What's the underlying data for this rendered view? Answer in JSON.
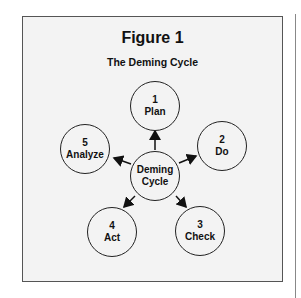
{
  "figure": {
    "title": "Figure 1",
    "subtitle": "The Deming Cycle"
  },
  "center": {
    "line1": "Deming",
    "line2": "Cycle"
  },
  "steps": [
    {
      "number": "1",
      "label": "Plan"
    },
    {
      "number": "2",
      "label": "Do"
    },
    {
      "number": "3",
      "label": "Check"
    },
    {
      "number": "4",
      "label": "Act"
    },
    {
      "number": "5",
      "label": "Analyze"
    }
  ]
}
